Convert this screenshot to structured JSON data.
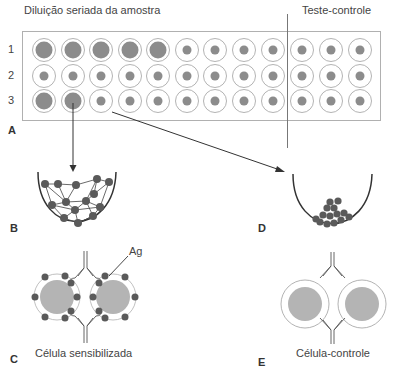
{
  "header": {
    "left_title": "Diluição seriada da amostra",
    "right_title": "Teste-controle"
  },
  "plate": {
    "row_labels": [
      "1",
      "2",
      "3"
    ],
    "rows": [
      [
        "large",
        "large",
        "large",
        "large",
        "large",
        "small",
        "small",
        "small",
        "small",
        "small",
        "small",
        "small"
      ],
      [
        "small",
        "small",
        "small",
        "small",
        "small",
        "small",
        "small",
        "small",
        "small",
        "small",
        "small",
        "small"
      ],
      [
        "large",
        "large",
        "small",
        "small",
        "small",
        "small",
        "small",
        "small",
        "small",
        "small",
        "small",
        "small"
      ]
    ],
    "test_columns": 9,
    "control_columns": 3
  },
  "panels": {
    "A": "A",
    "B": "B",
    "C": "C",
    "D": "D",
    "E": "E"
  },
  "captions": {
    "sensitized": "Célula sensibilizada",
    "control": "Célula-controle",
    "antigen": "Ag"
  },
  "colors": {
    "well_ring": "#a0a0a0",
    "well_fill": "#8c8c8c",
    "cell_fill": "#b4b4b4",
    "antigen": "#5a5a5a",
    "line": "#333333"
  }
}
